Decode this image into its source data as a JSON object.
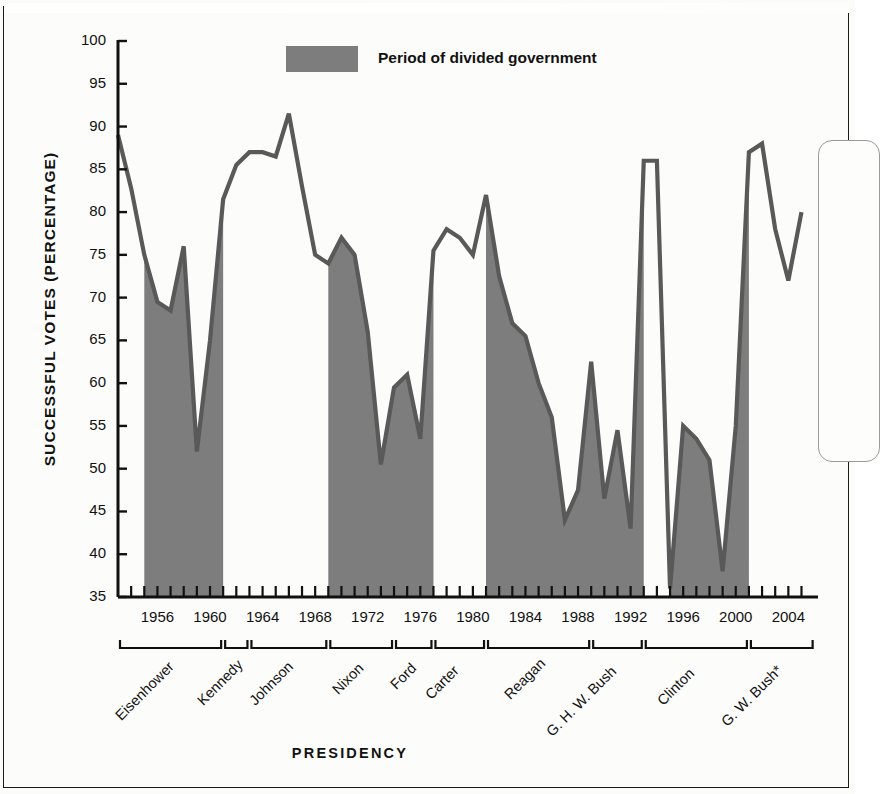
{
  "figure": {
    "legend_label": "Period of divided government",
    "legend_swatch_color": "#7d7d7d"
  },
  "chart_data": {
    "type": "area",
    "title": "",
    "xlabel": "PRESIDENCY",
    "ylabel": "SUCCESSFUL VOTES (PERCENTAGE)",
    "ylim": [
      35,
      100
    ],
    "xlim": [
      1953,
      2006
    ],
    "grid": false,
    "legend_position": "top-center",
    "series_name": "Successful presidential votes in Congress",
    "y_ticks": [
      100,
      95,
      90,
      85,
      80,
      75,
      70,
      65,
      60,
      55,
      50,
      45,
      40,
      35
    ],
    "x_ticks": [
      1956,
      1960,
      1964,
      1968,
      1972,
      1976,
      1980,
      1984,
      1988,
      1992,
      1996,
      2000,
      2004
    ],
    "x": [
      1953,
      1954,
      1955,
      1956,
      1957,
      1958,
      1959,
      1960,
      1961,
      1962,
      1963,
      1964,
      1965,
      1966,
      1967,
      1968,
      1969,
      1970,
      1971,
      1972,
      1973,
      1974,
      1975,
      1976,
      1977,
      1978,
      1979,
      1980,
      1981,
      1982,
      1983,
      1984,
      1985,
      1986,
      1987,
      1988,
      1989,
      1990,
      1991,
      1992,
      1993,
      1994,
      1995,
      1996,
      1997,
      1998,
      1999,
      2000,
      2001,
      2002,
      2003,
      2004,
      2005
    ],
    "values": [
      89.0,
      82.8,
      75.0,
      69.5,
      68.5,
      76.0,
      52.0,
      65.0,
      81.5,
      85.5,
      87.0,
      87.0,
      86.5,
      91.5,
      83.0,
      75.0,
      74.0,
      77.0,
      75.0,
      66.0,
      50.5,
      59.5,
      61.0,
      53.5,
      75.5,
      78.0,
      77.0,
      75.0,
      82.0,
      72.5,
      67.0,
      65.5,
      60.0,
      56.0,
      44.0,
      47.5,
      62.5,
      46.5,
      54.5,
      43.0,
      86.0,
      86.0,
      36.0,
      55.0,
      53.5,
      51.0,
      38.0,
      55.0,
      87.0,
      88.0,
      78.0,
      72.0,
      80.0
    ],
    "divided_government_periods": [
      {
        "label": "Eisenhower 1955-1960",
        "start": 1955,
        "end": 1961
      },
      {
        "label": "Nixon/Ford 1969-1976",
        "start": 1969,
        "end": 1977
      },
      {
        "label": "Reagan/Bush 1981-1992",
        "start": 1981,
        "end": 1993
      },
      {
        "label": "Clinton 1995-2000",
        "start": 1995,
        "end": 2001
      }
    ],
    "presidencies": [
      {
        "name": "Eisenhower",
        "start": 1953,
        "end": 1961
      },
      {
        "name": "Kennedy",
        "start": 1961,
        "end": 1963
      },
      {
        "name": "Johnson",
        "start": 1963,
        "end": 1969
      },
      {
        "name": "Nixon",
        "start": 1969,
        "end": 1974
      },
      {
        "name": "Ford",
        "start": 1974,
        "end": 1977
      },
      {
        "name": "Carter",
        "start": 1977,
        "end": 1981
      },
      {
        "name": "Reagan",
        "start": 1981,
        "end": 1989
      },
      {
        "name": "G. H. W. Bush",
        "start": 1989,
        "end": 1993
      },
      {
        "name": "Clinton",
        "start": 1993,
        "end": 2001
      },
      {
        "name": "G. W. Bush*",
        "start": 2001,
        "end": 2006
      }
    ]
  },
  "y_tick_labels": [
    "100",
    "95",
    "90",
    "85",
    "80",
    "75",
    "70",
    "65",
    "60",
    "55",
    "50",
    "45",
    "40",
    "35"
  ],
  "x_tick_labels": [
    "1956",
    "1960",
    "1964",
    "1968",
    "1972",
    "1976",
    "1980",
    "1984",
    "1988",
    "1992",
    "1996",
    "2000",
    "2004"
  ],
  "presidency_labels": [
    "Eisenhower",
    "Kennedy",
    "Johnson",
    "Nixon",
    "Ford",
    "Carter",
    "Reagan",
    "G. H. W. Bush",
    "Clinton",
    "G. W. Bush*"
  ]
}
